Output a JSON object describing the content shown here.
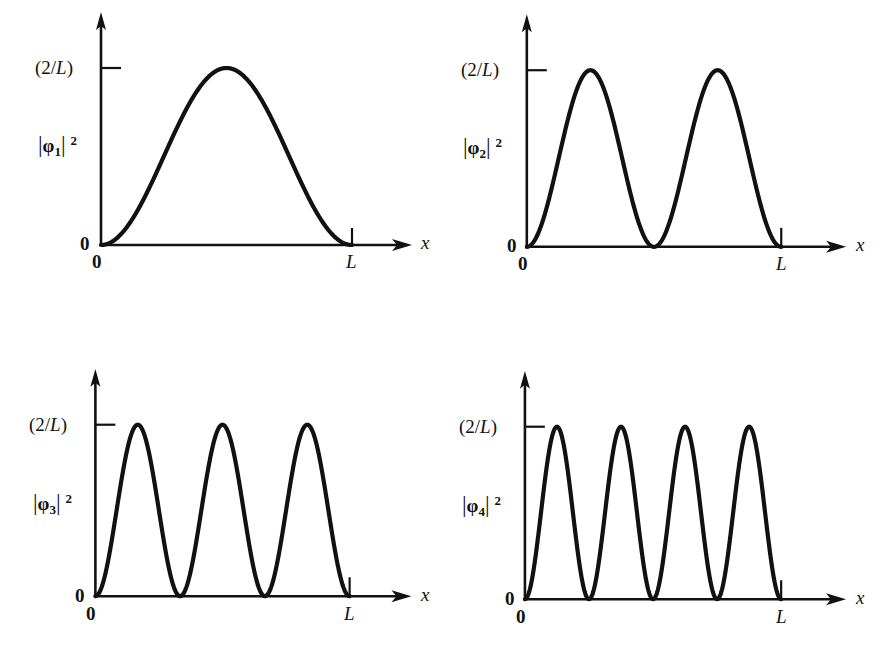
{
  "figure": {
    "background_color": "#ffffff",
    "ink_color": "#111111",
    "panel_count": 4
  },
  "chart_data": {
    "type": "line",
    "xlabel": "x",
    "ylabel": "|φn|²",
    "xlim": [
      0,
      1
    ],
    "ylim": [
      0,
      1
    ],
    "grid": false,
    "legend": "none",
    "x_tick_labels": [
      "0",
      "L"
    ],
    "x_tick_values": [
      0,
      1
    ],
    "y_tick_labels": [
      "0",
      "(2/L)"
    ],
    "y_tick_values": [
      0,
      1
    ],
    "shared_note": "Each curve is y = (2/L) sin^2(nπx/L) plotted from x=0 to x=L",
    "series": [
      {
        "name": "|φ1|²",
        "n": 1,
        "lobes": 1,
        "nodes_interior": 0,
        "peak_value": "(2/L)",
        "peak_x_fractions": [
          0.5
        ],
        "node_x_fractions": [
          0.0,
          1.0
        ],
        "formula": "(2/L) sin^2(πx/L)"
      },
      {
        "name": "|φ2|²",
        "n": 2,
        "lobes": 2,
        "nodes_interior": 1,
        "peak_value": "(2/L)",
        "peak_x_fractions": [
          0.25,
          0.75
        ],
        "node_x_fractions": [
          0.0,
          0.5,
          1.0
        ],
        "formula": "(2/L) sin^2(2πx/L)"
      },
      {
        "name": "|φ3|²",
        "n": 3,
        "lobes": 3,
        "nodes_interior": 2,
        "peak_value": "(2/L)",
        "peak_x_fractions": [
          0.1667,
          0.5,
          0.8333
        ],
        "node_x_fractions": [
          0.0,
          0.3333,
          0.6667,
          1.0
        ],
        "formula": "(2/L) sin^2(3πx/L)"
      },
      {
        "name": "|φ4|²",
        "n": 4,
        "lobes": 4,
        "nodes_interior": 3,
        "peak_value": "(2/L)",
        "peak_x_fractions": [
          0.125,
          0.375,
          0.625,
          0.875
        ],
        "node_x_fractions": [
          0.0,
          0.25,
          0.5,
          0.75,
          1.0
        ],
        "formula": "(2/L) sin^2(4πx/L)"
      }
    ]
  },
  "panels": [
    {
      "id": "panel-1",
      "y_axis_tick_label": "(2/L)",
      "y_axis_tick_label_paren_open": "(",
      "y_axis_tick_label_num": "2/",
      "y_axis_tick_label_L": "L",
      "y_axis_tick_label_paren_close": ")",
      "y_axis_label_bar_left": "|",
      "y_axis_label_phi": "φ",
      "y_axis_label_sub": "1",
      "y_axis_label_bar_right": "|",
      "y_axis_label_sup": "2",
      "y_origin_label": "0",
      "x_origin_label": "0",
      "x_end_label": "L",
      "x_axis_label": "x"
    },
    {
      "id": "panel-2",
      "y_axis_tick_label": "(2/L)",
      "y_axis_tick_label_paren_open": "(",
      "y_axis_tick_label_num": "2/",
      "y_axis_tick_label_L": "L",
      "y_axis_tick_label_paren_close": ")",
      "y_axis_label_bar_left": "|",
      "y_axis_label_phi": "φ",
      "y_axis_label_sub": "2",
      "y_axis_label_bar_right": "|",
      "y_axis_label_sup": "2",
      "y_origin_label": "0",
      "x_origin_label": "0",
      "x_end_label": "L",
      "x_axis_label": "x"
    },
    {
      "id": "panel-3",
      "y_axis_tick_label": "(2/L)",
      "y_axis_tick_label_paren_open": "(",
      "y_axis_tick_label_num": "2/",
      "y_axis_tick_label_L": "L",
      "y_axis_tick_label_paren_close": ")",
      "y_axis_label_bar_left": "|",
      "y_axis_label_phi": "φ",
      "y_axis_label_sub": "3",
      "y_axis_label_bar_right": "|",
      "y_axis_label_sup": "2",
      "y_origin_label": "0",
      "x_origin_label": "0",
      "x_end_label": "L",
      "x_axis_label": "x"
    },
    {
      "id": "panel-4",
      "y_axis_tick_label": "(2/L)",
      "y_axis_tick_label_paren_open": "(",
      "y_axis_tick_label_num": "2/",
      "y_axis_tick_label_L": "L",
      "y_axis_tick_label_paren_close": ")",
      "y_axis_label_bar_left": "|",
      "y_axis_label_phi": "φ",
      "y_axis_label_sub": "4",
      "y_axis_label_bar_right": "|",
      "y_axis_label_sup": "2",
      "y_origin_label": "0",
      "x_origin_label": "0",
      "x_end_label": "L",
      "x_axis_label": "x"
    }
  ]
}
